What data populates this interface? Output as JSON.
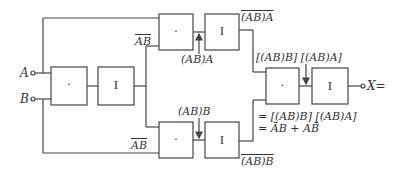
{
  "diagram": {
    "inputs": [
      {
        "name": "A",
        "label": "A"
      },
      {
        "name": "B",
        "label": "B"
      }
    ],
    "output": {
      "name": "X",
      "label": "X="
    },
    "gates": {
      "and_symbol": "·",
      "inv_symbol": "I"
    },
    "labels": {
      "nand_ab_top": "AB",
      "nand_ab_bottom": "AB",
      "top_and_output": "(AB)A",
      "top_inv_output": "(AB)A",
      "bottom_and_output": "(AB)B",
      "bottom_inv_output": "(AB)B",
      "final_inputs": "[(AB)B] [(AB)A]",
      "result_line1": "= [(AB)B] [(AB)A]",
      "result_line2": "= ĀB + AB̄"
    }
  }
}
